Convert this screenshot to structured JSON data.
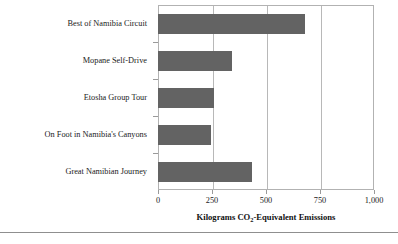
{
  "chart_data": {
    "type": "bar",
    "orientation": "horizontal",
    "title": "",
    "xlabel": "Kilograms CO2-Equivalent Emissions",
    "xlabel_parts": {
      "before": "Kilograms CO",
      "sub": "2",
      "after": "-Equivalent Emissions"
    },
    "ylabel": "",
    "categories": [
      "Best of Namibia Circuit",
      "Mopane Self-Drive",
      "Etosha Group Tour",
      "On Foot in Namibia's Canyons",
      "Great Namibian Journey"
    ],
    "values": [
      680,
      342,
      260,
      245,
      435
    ],
    "xlim": [
      0,
      1000
    ],
    "xticks": [
      0,
      250,
      500,
      750,
      1000
    ],
    "xticklabels": [
      "0",
      "250",
      "500",
      "750",
      "1,000"
    ],
    "grid": "vertical",
    "legend": "none",
    "bar_color": "#636363",
    "gridline_color": "#b8b8b8",
    "frame_color": "#b2b2b2"
  }
}
